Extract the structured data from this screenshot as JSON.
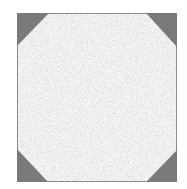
{
  "figure": {
    "square": {
      "x": 17,
      "y": 13,
      "width": 160,
      "height": 169,
      "fill": "#efefef",
      "stroke": "#8a8a8a"
    },
    "corner_triangle_color": "#7a7a7a",
    "corner_triangle_size": 32,
    "corners": [
      "top-left",
      "top-right",
      "bottom-left",
      "bottom-right"
    ]
  }
}
